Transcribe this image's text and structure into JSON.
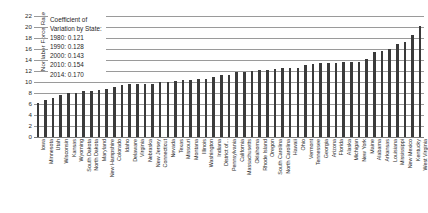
{
  "chart_data": {
    "type": "bar",
    "title": "",
    "xlabel": "",
    "ylabel": "Nonlabor Force Rate",
    "ylim": [
      0,
      22
    ],
    "ytick_step": 2,
    "yticks": [
      0,
      2,
      4,
      6,
      8,
      10,
      12,
      14,
      16,
      18,
      20,
      22
    ],
    "grid": true,
    "legend_position": "none",
    "bar_color": "#3a3a3a",
    "gridline_color": "#9a9a9a",
    "categories": [
      "Iowa",
      "Minnesota",
      "Utah",
      "Wisconsin",
      "Kansas",
      "Wyoming",
      "South Dakota",
      "North Dakota",
      "Maryland",
      "New Hampshire",
      "Colorado",
      "Idaho",
      "Delaware",
      "Virginia",
      "Nebraska",
      "New Jersey",
      "Connecticut",
      "Nevada",
      "Texas",
      "Missouri",
      "Montana",
      "Illinois",
      "Washington",
      "Indiana",
      "District of...",
      "Pennsylvania",
      "California",
      "Massachusetts",
      "Oklahoma",
      "Rhode Island",
      "Oregon",
      "South Carolina",
      "North Carolina",
      "Hawaii",
      "Ohio",
      "Vermont",
      "Tennessee",
      "Georgia",
      "Arizona",
      "Florida",
      "Alaska",
      "Michigan",
      "New York",
      "Maine",
      "Alabama",
      "Arkansas",
      "Louisiana",
      "Mississippi",
      "New Mexico",
      "Kentucky",
      "West Virginia"
    ],
    "values": [
      6.2,
      6.8,
      7.1,
      7.7,
      8.0,
      8.0,
      8.3,
      8.4,
      8.6,
      8.8,
      9.1,
      9.5,
      9.6,
      9.6,
      9.6,
      9.6,
      10.0,
      10.0,
      10.1,
      10.4,
      10.4,
      10.5,
      10.6,
      10.9,
      11.2,
      11.3,
      11.8,
      11.9,
      12.0,
      12.1,
      12.2,
      12.4,
      12.5,
      12.6,
      12.6,
      13.1,
      13.2,
      13.4,
      13.4,
      13.5,
      13.6,
      13.7,
      13.7,
      14.2,
      15.5,
      15.7,
      16.0,
      16.9,
      17.3,
      18.6,
      20.1
    ],
    "annotation": {
      "heading_line1": "Coefficient of",
      "heading_line2": "Variation by State:",
      "entries": [
        "1980: 0.121",
        "1990: 0.128",
        "2000: 0.143",
        "2010: 0.154",
        "2014: 0.170"
      ]
    }
  }
}
